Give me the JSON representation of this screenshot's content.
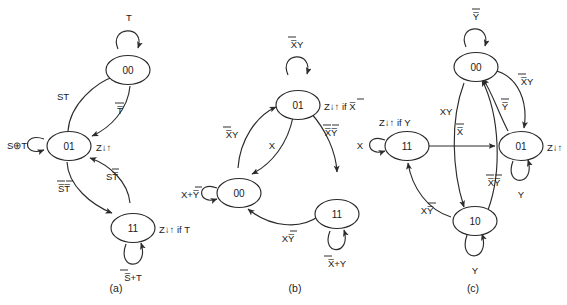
{
  "figure": {
    "background_color": "#ffffff",
    "stroke_color": "#2b2b2b",
    "text_color": "#1a1a1a"
  },
  "diagrams": [
    {
      "id": "a",
      "caption": "(a)",
      "inputs": [
        "S",
        "T"
      ],
      "output": "Z",
      "states": [
        {
          "name": "00",
          "output_label": ""
        },
        {
          "name": "01",
          "output_label": "Z↓↑"
        },
        {
          "name": "11",
          "output_label": "Z↓↑ if T"
        }
      ],
      "self_loops": [
        {
          "state": "00",
          "condition": "T"
        },
        {
          "state": "01",
          "condition": "S⊕T"
        },
        {
          "state": "11",
          "condition": "S̅+T"
        }
      ],
      "transitions": [
        {
          "from": "01",
          "to": "00",
          "condition": "ST"
        },
        {
          "from": "00",
          "to": "01",
          "condition": "T̅"
        },
        {
          "from": "01",
          "to": "11",
          "condition": "S̅T̅"
        },
        {
          "from": "11",
          "to": "01",
          "condition": "ST̅"
        }
      ]
    },
    {
      "id": "b",
      "caption": "(b)",
      "inputs": [
        "X",
        "Y"
      ],
      "output": "Z",
      "states": [
        {
          "name": "01",
          "output_label": "Z↓↑ if X̅"
        },
        {
          "name": "00",
          "output_label": ""
        },
        {
          "name": "11",
          "output_label": ""
        }
      ],
      "self_loops": [
        {
          "state": "01",
          "condition": "X̅Y"
        },
        {
          "state": "00",
          "condition": "X+Y̅"
        },
        {
          "state": "11",
          "condition": "X̅+Y"
        }
      ],
      "transitions": [
        {
          "from": "00",
          "to": "01",
          "condition": "X̅Y"
        },
        {
          "from": "01",
          "to": "00",
          "condition": "X"
        },
        {
          "from": "01",
          "to": "11",
          "condition": "X̅Y̅"
        },
        {
          "from": "11",
          "to": "00",
          "condition": "XY̅"
        }
      ]
    },
    {
      "id": "c",
      "caption": "(c)",
      "inputs": [
        "X",
        "Y"
      ],
      "output": "Z",
      "states": [
        {
          "name": "00",
          "output_label": ""
        },
        {
          "name": "11",
          "output_label": "Z↓↑ if Y"
        },
        {
          "name": "01",
          "output_label": "Z↓↑"
        },
        {
          "name": "10",
          "output_label": ""
        }
      ],
      "self_loops": [
        {
          "state": "00",
          "condition": "Y̅"
        },
        {
          "state": "11",
          "condition": "X"
        },
        {
          "state": "01",
          "condition": "Y"
        },
        {
          "state": "10",
          "condition": "Y"
        }
      ],
      "transitions": [
        {
          "from": "00",
          "to": "01",
          "condition": "X̅Y"
        },
        {
          "from": "01",
          "to": "00",
          "condition": "Y̅"
        },
        {
          "from": "11",
          "to": "01",
          "condition": "X̅"
        },
        {
          "from": "00",
          "to": "10",
          "condition": "XY"
        },
        {
          "from": "10",
          "to": "00",
          "condition": "X̅Y̅"
        },
        {
          "from": "10",
          "to": "11",
          "condition": "XY̅"
        }
      ]
    }
  ]
}
